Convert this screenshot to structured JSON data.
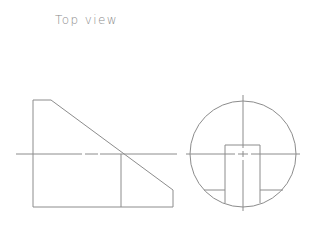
{
  "title": "Top view",
  "colors": {
    "line": "#8c8c8c",
    "text": "#8a8a8a",
    "background": "#ffffff"
  },
  "drawing": {
    "left_view": {
      "outline": "33,207 33,100 51,100 173,190 173,207",
      "divider": {
        "x": 121,
        "y1": 154,
        "y2": 207
      },
      "bottom": {
        "x1": 33,
        "x2": 173,
        "y": 207
      }
    },
    "centerline_horizontal_left": [
      [
        16,
        82
      ],
      [
        85,
        98
      ],
      [
        100,
        177
      ]
    ],
    "centerline_horizontal_right": [
      [
        186,
        235
      ],
      [
        238,
        248
      ],
      [
        251,
        300
      ]
    ],
    "right_view": {
      "circle": {
        "cx": 243,
        "cy": 154,
        "r": 53
      },
      "slot": {
        "x1": 225,
        "x2": 260,
        "top": 145
      },
      "ledge_y": 190,
      "centerline_vertical": [
        [
          95,
          148
        ],
        [
          151,
          157
        ],
        [
          160,
          211
        ]
      ]
    }
  }
}
